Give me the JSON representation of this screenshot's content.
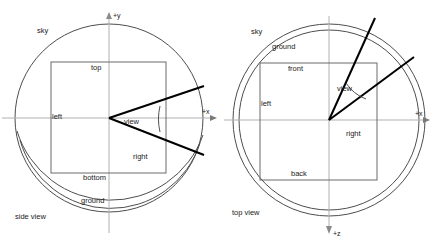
{
  "figure": {
    "type": "technical-line-diagram",
    "background_color": "#ffffff",
    "line_color": "#4d4d4d",
    "ray_color": "#000000"
  },
  "panels": [
    {
      "id": "side-view",
      "caption": "side view",
      "caption_position": "bottom-left",
      "circle_label_outer": "sky",
      "circle_label_inner": "ground",
      "axes": [
        {
          "name": "y-axis",
          "label": "+y",
          "direction": "up"
        },
        {
          "name": "x-axis",
          "label": "+x",
          "direction": "right"
        }
      ],
      "box_labels": {
        "top": "top",
        "bottom": "bottom",
        "left": "left",
        "right": "right"
      },
      "frustum": {
        "label": "view",
        "has_angle_arc": true,
        "ray_count": 2,
        "apex": "center"
      }
    },
    {
      "id": "top-view",
      "caption": "top view",
      "caption_position": "bottom-left",
      "circle_label_outer": "sky",
      "circle_label_inner": "ground",
      "axes": [
        {
          "name": "x-axis",
          "label": "+x",
          "direction": "right"
        },
        {
          "name": "z-axis",
          "label": "+z",
          "direction": "down"
        }
      ],
      "box_labels": {
        "top": "front",
        "bottom": "back",
        "left": "left",
        "right": "right"
      },
      "frustum": {
        "label": "view",
        "has_angle_arc": true,
        "ray_count": 2,
        "apex": "center"
      }
    }
  ]
}
